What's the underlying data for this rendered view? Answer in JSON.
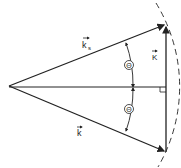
{
  "diagram": {
    "labels": {
      "ks": "k",
      "ks_sub": "s",
      "k": "k",
      "K": "K",
      "theta_top": "Θ",
      "theta_bottom": "Θ"
    },
    "colors": {
      "stroke": "#222222",
      "background": "#ffffff"
    }
  }
}
